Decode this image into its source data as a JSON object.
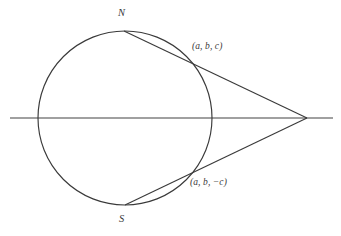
{
  "figure": {
    "type": "geometry-diagram",
    "background_color": "#ffffff",
    "stroke_color": "#3a3a3a",
    "axis_color": "#808080",
    "label_color": "#3a3a3a"
  },
  "labels": {
    "north_pole": "N",
    "south_pole": "S",
    "upper_point": "(a, b, c)",
    "lower_point": "(a, b, −c)"
  },
  "geometry": {
    "circle": {
      "cx": 125,
      "cy": 118,
      "r": 87
    },
    "axis": {
      "x1": 10,
      "y1": 118,
      "x2": 333,
      "y2": 118
    },
    "north_point": {
      "x": 124,
      "y": 31
    },
    "south_point": {
      "x": 125,
      "y": 205
    },
    "apex": {
      "x": 307,
      "y": 118
    },
    "upper_intersection": {
      "x": 196,
      "y": 62
    },
    "lower_intersection": {
      "x": 197,
      "y": 174
    }
  }
}
